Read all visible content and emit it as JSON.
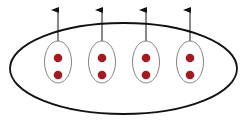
{
  "diagram": {
    "outer_ellipse": {
      "cx": 123.5,
      "cy": 68.5,
      "rx": 113.5,
      "ry": 45.5,
      "stroke": "#111111",
      "stroke_width": 1.8
    },
    "groups": [
      {
        "cx": 58,
        "cy": 62,
        "rx": 13.5,
        "ry": 21,
        "dots": [
          58,
          75
        ]
      },
      {
        "cx": 102,
        "cy": 62,
        "rx": 13.5,
        "ry": 21,
        "dots": [
          58,
          75
        ]
      },
      {
        "cx": 146,
        "cy": 62,
        "rx": 13.5,
        "ry": 21,
        "dots": [
          58,
          75
        ]
      },
      {
        "cx": 190,
        "cy": 62,
        "rx": 13.5,
        "ry": 21,
        "dots": [
          58,
          75
        ]
      }
    ],
    "group_stroke": "#8a7f85",
    "dot_color": "#a01c22",
    "dot_radius": 4.3,
    "arrow_color": "#111111",
    "arrow_tip_y": 9
  }
}
